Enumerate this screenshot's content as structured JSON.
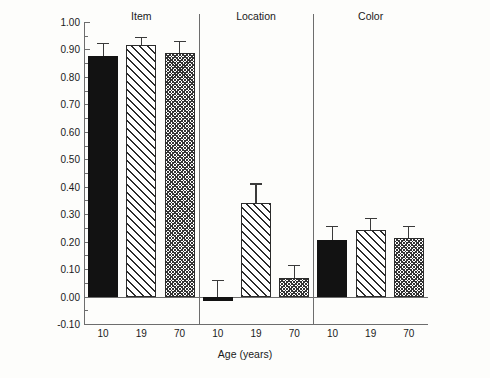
{
  "chart_data": {
    "type": "bar",
    "title": "",
    "xlabel": "Age (years)",
    "ylabel": "Corrected Recognition",
    "ylim": [
      -0.1,
      1.0
    ],
    "ytick_labels": [
      "1.00",
      "0.90",
      "0.80",
      "0.70",
      "0.60",
      "0.50",
      "0.40",
      "0.30",
      "0.20",
      "0.10",
      "0.00",
      "-0.10"
    ],
    "ytick_values": [
      1.0,
      0.9,
      0.8,
      0.7,
      0.6,
      0.5,
      0.4,
      0.3,
      0.2,
      0.1,
      0.0,
      -0.1
    ],
    "grid": false,
    "legend": "none",
    "categories": [
      "10",
      "19",
      "70"
    ],
    "groups": [
      {
        "name": "Item",
        "bars": [
          {
            "category": "10",
            "value": 0.875,
            "error_top": 0.925,
            "fill": "solid"
          },
          {
            "category": "19",
            "value": 0.915,
            "error_top": 0.945,
            "fill": "hatch"
          },
          {
            "category": "70",
            "value": 0.888,
            "error_top": 0.93,
            "fill": "cross"
          }
        ]
      },
      {
        "name": "Location",
        "bars": [
          {
            "category": "10",
            "value": -0.018,
            "error_top": 0.062,
            "fill": "solid"
          },
          {
            "category": "19",
            "value": 0.34,
            "error_top": 0.412,
            "fill": "hatch"
          },
          {
            "category": "70",
            "value": 0.068,
            "error_top": 0.115,
            "fill": "cross"
          }
        ]
      },
      {
        "name": "Color",
        "bars": [
          {
            "category": "10",
            "value": 0.205,
            "error_top": 0.258,
            "fill": "solid"
          },
          {
            "category": "19",
            "value": 0.242,
            "error_top": 0.285,
            "fill": "hatch"
          },
          {
            "category": "70",
            "value": 0.215,
            "error_top": 0.258,
            "fill": "cross"
          }
        ]
      }
    ]
  }
}
